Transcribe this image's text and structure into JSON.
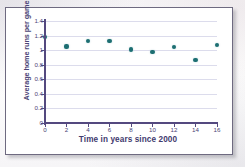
{
  "chart_data": {
    "type": "scatter",
    "title": "",
    "xlabel": "Time in years since 2000",
    "ylabel": "Average home runs per game",
    "xlim": [
      0,
      16
    ],
    "ylim": [
      0,
      1.4
    ],
    "grid": true,
    "legend": false,
    "x": [
      0,
      2,
      4,
      6,
      8,
      10,
      12,
      14,
      16
    ],
    "values": [
      1.18,
      1.05,
      1.13,
      1.12,
      1.01,
      0.97,
      1.04,
      0.87,
      1.07
    ],
    "points": [
      {
        "x": 0,
        "y": 1.18
      },
      {
        "x": 2,
        "y": 1.05
      },
      {
        "x": 4,
        "y": 1.13
      },
      {
        "x": 6,
        "y": 1.12
      },
      {
        "x": 8,
        "y": 1.01
      },
      {
        "x": 10,
        "y": 0.97
      },
      {
        "x": 12,
        "y": 1.04
      },
      {
        "x": 14,
        "y": 0.87
      },
      {
        "x": 16,
        "y": 1.07
      }
    ],
    "xticks": [
      0,
      2,
      4,
      6,
      8,
      10,
      12,
      14,
      16
    ],
    "xtick_labels": [
      "0",
      "2",
      "4",
      "6",
      "8",
      "10",
      "12",
      "14",
      "16"
    ],
    "yticks": [
      0,
      0.2,
      0.4,
      0.6,
      0.8,
      1,
      1.2,
      1.4
    ],
    "ytick_labels": [
      "0",
      "0.2",
      "0.4",
      "0.6",
      "0.8",
      "1",
      "1.2",
      "1.4"
    ],
    "colors": {
      "point": "#1d6e72",
      "axis": "#54497f",
      "grid": "#dcdcec",
      "label": "#4b4576",
      "plot_background": "#ffffff",
      "frame_border": "#6e6a80"
    }
  }
}
